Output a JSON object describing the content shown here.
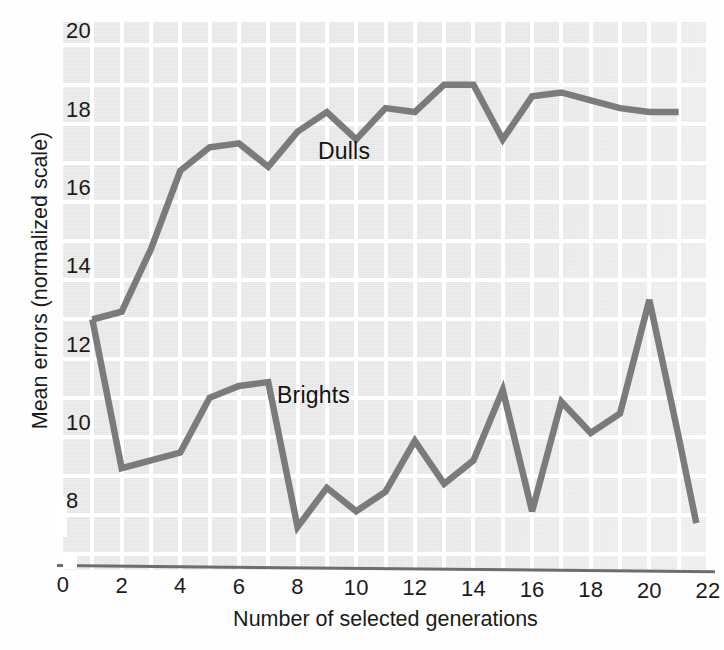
{
  "figure": {
    "background_color": "#fefefe",
    "plot_background_color": "#e3e3e3",
    "gridline_color": "#ffffff",
    "line_color": "#7b7b7b",
    "axis_color": "#6d6d6d",
    "text_color": "#1b1b1b"
  },
  "chart_data": {
    "type": "line",
    "title": "",
    "subtitle": "",
    "xlabel": "Number of selected generations",
    "ylabel": "Mean errors (normalized scale)",
    "xlim": [
      0,
      22
    ],
    "ylim": [
      6.6,
      20.6
    ],
    "xticks": [
      0,
      2,
      4,
      6,
      8,
      10,
      12,
      14,
      16,
      18,
      20,
      22
    ],
    "yticks": [
      8,
      10,
      12,
      14,
      16,
      18,
      20
    ],
    "xtick_labels": [
      "0",
      "2",
      "4",
      "6",
      "8",
      "10",
      "12",
      "14",
      "16",
      "18",
      "20",
      "22"
    ],
    "ytick_labels": [
      "8",
      "10",
      "12",
      "14",
      "16",
      "18",
      "20"
    ],
    "grid": true,
    "grid_axis": "both",
    "legend": "inline-annotation",
    "annotations": [
      {
        "text": "Dulls",
        "x": 9.7,
        "y": 17.1
      },
      {
        "text": "Brights",
        "x": 8.9,
        "y": 10.6
      }
    ],
    "series": [
      {
        "name": "Dulls",
        "color": "#7b7b7b",
        "x": [
          1,
          2,
          3,
          4,
          5,
          6,
          7,
          8,
          9,
          10,
          11,
          12,
          13,
          14,
          15,
          16,
          17,
          18,
          19,
          20,
          21
        ],
        "values": [
          13.0,
          13.2,
          14.8,
          16.8,
          17.4,
          17.5,
          16.9,
          17.8,
          18.3,
          17.6,
          18.4,
          18.3,
          19.0,
          19.0,
          17.6,
          18.7,
          18.8,
          18.6,
          18.4,
          18.3,
          18.3
        ]
      },
      {
        "name": "Brights",
        "color": "#7b7b7b",
        "x": [
          1,
          2,
          3,
          4,
          5,
          6,
          7,
          8,
          9,
          10,
          11,
          12,
          13,
          14,
          15,
          16,
          17,
          18,
          19,
          20,
          21
        ],
        "values": [
          13.0,
          9.2,
          9.4,
          9.6,
          11.0,
          11.3,
          11.4,
          7.7,
          8.7,
          8.1,
          8.6,
          9.9,
          8.8,
          9.4,
          11.2,
          8.1,
          10.9,
          10.1,
          10.6,
          13.5,
          10.0
        ]
      }
    ],
    "series_b_tail": {
      "note": "Brights final descent",
      "x": [
        21,
        21.6
      ],
      "values": [
        10.0,
        7.8
      ]
    }
  },
  "axis_titles": {
    "x": "Number of selected generations",
    "y": "Mean errors (normalized scale)"
  }
}
